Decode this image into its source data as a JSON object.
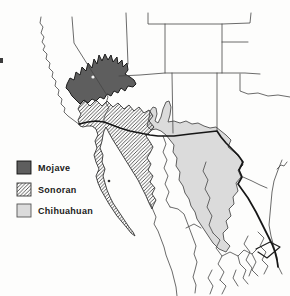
{
  "figure": {
    "type": "desert-regions-map",
    "area_shown": "Southwestern United States and Mexico"
  },
  "legend": {
    "items": [
      {
        "label": "Mojave",
        "swatch": "solid-dark-square"
      },
      {
        "label": "Sonoran",
        "swatch": "diagonal-hatch-square"
      },
      {
        "label": "Chihuahuan",
        "swatch": "light-gray-square"
      }
    ]
  },
  "map": {
    "regions": [
      {
        "name": "Mojave"
      },
      {
        "name": "Sonoran"
      },
      {
        "name": "Chihuahuan"
      }
    ]
  },
  "colors": {
    "background": "#fdfdfc",
    "thin_line": "#454545",
    "thick_line": "#161616",
    "mojave_fill": "#5e5e5e",
    "mojave_stroke": "#1b1b1b",
    "sonoran_bg": "#ffffff",
    "sonoran_hatch_line": "#3f3f3f",
    "sonoran_stroke": "#333333",
    "chihuahuan_fill": "#dbdbdb",
    "chihuahuan_stroke": "#4d4d4d",
    "island_dot": "#333333",
    "legend_text": "#1a1a1a"
  }
}
